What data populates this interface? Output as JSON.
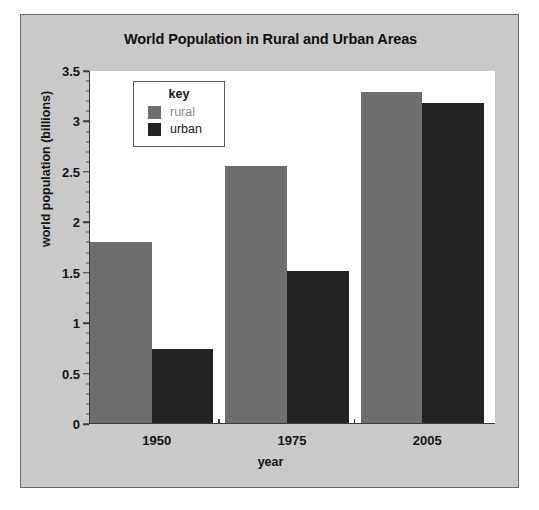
{
  "figure": {
    "title": "World Population in Rural and Urban Areas",
    "caption": ""
  },
  "legend": {
    "title": "key",
    "entries": [
      {
        "label": "rural",
        "color": "#6e6e6e"
      },
      {
        "label": "urban",
        "color": "#232323"
      }
    ]
  },
  "axes": {
    "y_title": "world population (billions)",
    "x_title": "year",
    "y_ticks": [
      "0",
      "0.5",
      "1",
      "1.5",
      "2",
      "2.5",
      "3",
      "3.5"
    ],
    "x_ticks": [
      "1950",
      "1975",
      "2005"
    ]
  },
  "chart_data": {
    "type": "bar",
    "title": "World Population in Rural and Urban Areas",
    "xlabel": "year",
    "ylabel": "world population (billions)",
    "categories": [
      "1950",
      "1975",
      "2005"
    ],
    "series": [
      {
        "name": "rural",
        "color": "#6e6e6e",
        "values": [
          1.79,
          2.55,
          3.28
        ]
      },
      {
        "name": "urban",
        "color": "#232323",
        "values": [
          0.73,
          1.51,
          3.17
        ]
      }
    ],
    "ylim": [
      0,
      3.5
    ],
    "ytick_step": 0.5,
    "yminor_step": 0.1,
    "grid": false,
    "legend_position": "upper-left-inside",
    "legend_title": "key"
  }
}
